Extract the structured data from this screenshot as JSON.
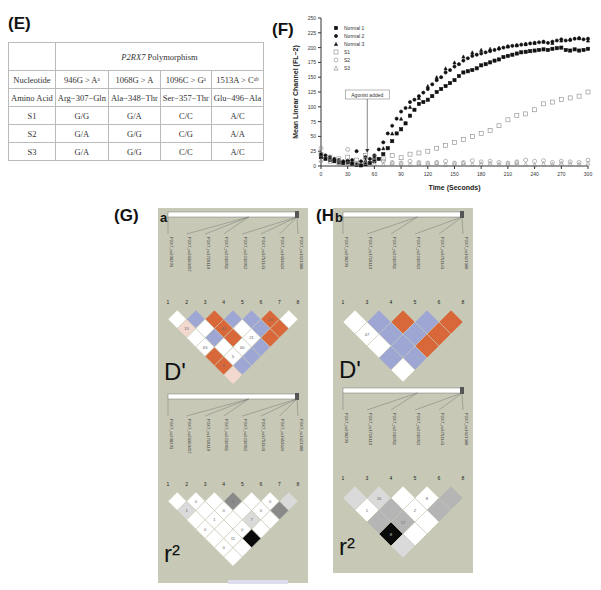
{
  "panels": {
    "E": {
      "label": "(E)"
    },
    "F": {
      "label": "(F)"
    },
    "G": {
      "label": "(G)",
      "sub": "a"
    },
    "H": {
      "label": "(H)",
      "sub": "b"
    }
  },
  "table": {
    "header_span": "P2RX7 Polymorphism",
    "header_italic": "P2RX7",
    "header_rest": " Polymorphism",
    "rows": [
      {
        "label": "Nucleotide",
        "cells": [
          "946G > Aᵃ",
          "1068G > A",
          "1096C > Gᵃ",
          "1513A > Cᵃᵇ"
        ]
      },
      {
        "label": "Amino Acid",
        "cells": [
          "Arg−307−Gln",
          "Ala−348−Thr",
          "Ser−357−Thr",
          "Glu−496−Ala"
        ]
      },
      {
        "label": "S1",
        "cells": [
          "G/G",
          "G/A",
          "C/C",
          "A/C"
        ]
      },
      {
        "label": "S2",
        "cells": [
          "G/A",
          "G/G",
          "C/G",
          "A/A"
        ]
      },
      {
        "label": "S3",
        "cells": [
          "G/A",
          "G/G",
          "C/C",
          "A/C"
        ]
      }
    ]
  },
  "chart_data": {
    "type": "scatter",
    "title": "",
    "xlabel": "Time (Seconds)",
    "ylabel": "Mean Linear Channel (FL−2)",
    "xlim": [
      0,
      300
    ],
    "ylim": [
      0,
      250
    ],
    "xticks": [
      0,
      30,
      60,
      90,
      120,
      150,
      180,
      210,
      240,
      270,
      300
    ],
    "yticks": [
      0,
      25,
      50,
      75,
      100,
      125,
      150,
      175,
      200,
      225,
      250
    ],
    "legend_position": "upper-left",
    "annotation": {
      "text": "Agonist added",
      "x": 52,
      "y": 22
    },
    "series": [
      {
        "name": "Normal 1",
        "marker": "filled-square",
        "x": [
          0,
          5,
          10,
          15,
          20,
          25,
          30,
          35,
          40,
          45,
          50,
          55,
          60,
          65,
          70,
          75,
          80,
          85,
          90,
          95,
          100,
          105,
          110,
          115,
          120,
          125,
          130,
          135,
          140,
          145,
          150,
          155,
          160,
          165,
          170,
          175,
          180,
          185,
          190,
          195,
          200,
          205,
          210,
          215,
          220,
          225,
          230,
          235,
          240,
          245,
          250,
          255,
          260,
          265,
          270,
          275,
          280,
          285,
          290,
          295,
          300
        ],
        "y": [
          15,
          12,
          10,
          8,
          6,
          5,
          7,
          4,
          2,
          1,
          3,
          5,
          8,
          12,
          20,
          30,
          42,
          55,
          62,
          72,
          85,
          95,
          105,
          108,
          112,
          118,
          125,
          130,
          135,
          140,
          145,
          152,
          158,
          160,
          162,
          165,
          170,
          172,
          175,
          178,
          180,
          184,
          186,
          188,
          190,
          192,
          193,
          194,
          195,
          196,
          197,
          196,
          198,
          199,
          200,
          196,
          195,
          197,
          195,
          196,
          198
        ]
      },
      {
        "name": "Normal 2",
        "marker": "filled-circle",
        "x": [
          0,
          5,
          10,
          15,
          20,
          25,
          30,
          35,
          40,
          45,
          50,
          55,
          60,
          65,
          70,
          75,
          80,
          85,
          90,
          95,
          100,
          105,
          110,
          115,
          120,
          125,
          130,
          135,
          140,
          145,
          150,
          155,
          160,
          165,
          170,
          175,
          180,
          185,
          190,
          195,
          200,
          205,
          210,
          215,
          220,
          225,
          230,
          235,
          240,
          245,
          250,
          255,
          260,
          265,
          270,
          275,
          280,
          285,
          290,
          295,
          300
        ],
        "y": [
          20,
          18,
          15,
          12,
          10,
          8,
          9,
          10,
          25,
          8,
          15,
          12,
          18,
          28,
          40,
          55,
          68,
          80,
          92,
          98,
          108,
          112,
          118,
          124,
          130,
          138,
          145,
          150,
          158,
          162,
          168,
          172,
          178,
          182,
          186,
          188,
          190,
          192,
          194,
          196,
          198,
          200,
          202,
          203,
          204,
          205,
          206,
          207,
          208,
          209,
          210,
          208,
          210,
          212,
          214,
          212,
          213,
          215,
          216,
          214,
          215
        ]
      },
      {
        "name": "Normal 3",
        "marker": "filled-triangle",
        "x": [
          0,
          10,
          20,
          30,
          40,
          50,
          60,
          70,
          80,
          90,
          100,
          110,
          120,
          130,
          140,
          150,
          160,
          170,
          180,
          190,
          200,
          210,
          220,
          230,
          240,
          250,
          260,
          270,
          280,
          290,
          300
        ],
        "y": [
          18,
          12,
          8,
          6,
          4,
          10,
          15,
          30,
          55,
          80,
          100,
          115,
          135,
          150,
          165,
          175,
          185,
          192,
          196,
          198,
          200,
          202,
          204,
          206,
          208,
          210,
          208,
          212,
          214,
          216,
          212
        ]
      },
      {
        "name": "S1",
        "marker": "open-square",
        "x": [
          0,
          10,
          20,
          30,
          40,
          50,
          60,
          70,
          80,
          90,
          100,
          110,
          120,
          130,
          140,
          150,
          160,
          170,
          180,
          190,
          200,
          210,
          220,
          230,
          240,
          250,
          260,
          270,
          280,
          290,
          300
        ],
        "y": [
          20,
          15,
          12,
          15,
          10,
          18,
          15,
          12,
          18,
          14,
          20,
          22,
          25,
          30,
          35,
          40,
          45,
          50,
          55,
          60,
          68,
          78,
          85,
          88,
          95,
          105,
          108,
          112,
          115,
          118,
          125
        ]
      },
      {
        "name": "S2",
        "marker": "open-circle",
        "x": [
          0,
          10,
          20,
          30,
          40,
          50,
          60,
          70,
          80,
          90,
          100,
          110,
          120,
          130,
          140,
          150,
          160,
          170,
          180,
          190,
          200,
          210,
          220,
          230,
          240,
          250,
          260,
          270,
          280,
          290,
          300
        ],
        "y": [
          30,
          12,
          8,
          28,
          5,
          12,
          10,
          8,
          6,
          5,
          8,
          6,
          5,
          6,
          8,
          5,
          6,
          9,
          7,
          8,
          6,
          5,
          7,
          10,
          8,
          9,
          6,
          8,
          7,
          6,
          10
        ]
      },
      {
        "name": "S3",
        "marker": "open-triangle",
        "x": [
          0,
          10,
          20,
          30,
          40,
          50,
          60,
          70,
          80,
          90,
          100,
          110,
          120,
          130,
          140,
          150,
          160,
          170,
          180,
          190,
          200,
          210,
          220,
          230,
          240,
          250,
          260,
          270,
          280,
          290,
          300
        ],
        "y": [
          10,
          8,
          6,
          5,
          4,
          6,
          4,
          3,
          5,
          4,
          3,
          5,
          4,
          6,
          3,
          4,
          5,
          3,
          4,
          5,
          3,
          4,
          6,
          3,
          2,
          4,
          3,
          5,
          4,
          3,
          5
        ]
      }
    ]
  },
  "ld_panels": {
    "G": {
      "snps": [
        "P2X7_rs208293",
        "P2X7_rs28360457",
        "P2X7_rs1718119",
        "P2X7_rs2230911",
        "P2X7_rs2230912",
        "P2X7_rs3751143",
        "P2X7_rs1653624",
        "P2X7_rs1621388"
      ],
      "indices": [
        "1",
        "2",
        "3",
        "4",
        "5",
        "6",
        "7",
        "8"
      ],
      "dprime_label": "D'",
      "r2_label": "r²",
      "dprime_values": [
        "24",
        "15",
        "41",
        "21",
        "65",
        "60",
        "5",
        "5",
        "48",
        "8",
        "79",
        "8",
        "38"
      ],
      "r2_values": [
        "0",
        "2",
        "0",
        "1",
        "0",
        "0",
        "1",
        "7",
        "0",
        "0",
        "11",
        "0",
        "3",
        "8",
        "0",
        "0",
        "14",
        "0",
        "4",
        "0",
        "0",
        "1",
        "57",
        "0",
        "0",
        "2",
        "0"
      ]
    },
    "H": {
      "snps": [
        "P2X7_rs208293",
        "P2X7_rs1718119",
        "P2X7_rs2230911",
        "P2X7_rs2230912",
        "P2X7_rs3751143",
        "P2X7_rs1621388"
      ],
      "indices": [
        "1",
        "3",
        "4",
        "5",
        "6",
        "8"
      ],
      "dprime_label": "D'",
      "r2_label": "r²",
      "dprime_values": [
        "47",
        "17",
        "7",
        "47"
      ],
      "r2_values": [
        "16",
        "8",
        "1",
        "2",
        "17",
        "8",
        "21",
        "5",
        "27",
        "0",
        "17",
        "8",
        "17",
        "17"
      ]
    }
  },
  "colors": {
    "panel_bg": "#c7c9b6",
    "blue": "#9ea7d4",
    "orange": "#d8673a",
    "white": "#ffffff",
    "pink": "#f2d8cf",
    "black": "#0a0a0a",
    "gray_dark": "#8a8a8a",
    "gray_mid": "#b5b5b5",
    "gray_light": "#dadada"
  }
}
